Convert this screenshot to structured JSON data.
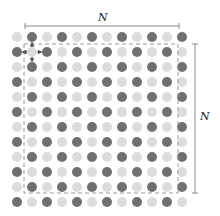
{
  "diagram": {
    "grid": {
      "rows": 12,
      "cols": 12,
      "origin_x": 17,
      "origin_y": 37,
      "spacing": 15,
      "dot_radius": 5,
      "pattern": "checkerboard: dark when (row+col) odd, light when even"
    },
    "colors": {
      "dark_dot": "#707070",
      "light_dot": "#dcdcdc",
      "dashed_box": "#9a9a9a",
      "bracket": "#8a8a8a",
      "arrow": "#555555"
    },
    "dashed_region": {
      "x1": 24,
      "y1": 44,
      "x2": 178,
      "y2": 193
    },
    "top_dimension": {
      "label": "N",
      "x1": 25,
      "x2": 179,
      "y": 26
    },
    "right_dimension": {
      "label": "N",
      "x": 195,
      "y1": 44,
      "y2": 193
    },
    "highlight": {
      "center_row": 1,
      "center_col": 1,
      "center_type": "light",
      "neighbors": "4 nearest dark neighbors (up, down, left, right) with arrows pointing outward"
    }
  }
}
